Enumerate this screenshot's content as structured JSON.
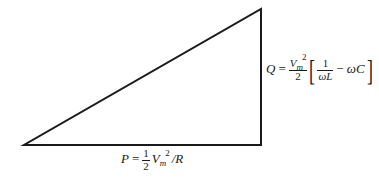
{
  "diagram": {
    "type": "power-triangle",
    "stroke_color": "#1a1a1a",
    "vertices": {
      "bottom_left": [
        24,
        145
      ],
      "bottom_right": [
        261,
        145
      ],
      "top_right": [
        261,
        9
      ]
    },
    "horizontal_side_label": {
      "lhs": "P",
      "equals": "=",
      "frac_num": "1",
      "frac_den": "2",
      "base": "V",
      "subscript": "m",
      "superscript": "2",
      "tail": "/R"
    },
    "vertical_side_label": {
      "lhs": "Q",
      "equals": "=",
      "frac_num_base": "V",
      "frac_num_sub": "m",
      "frac_num_sup": "2",
      "frac_den": "2",
      "open_bracket": "[",
      "inner_frac_num": "1",
      "inner_frac_den": "ωL",
      "minus": "−",
      "tail": "ωC",
      "close_bracket": "]"
    }
  }
}
